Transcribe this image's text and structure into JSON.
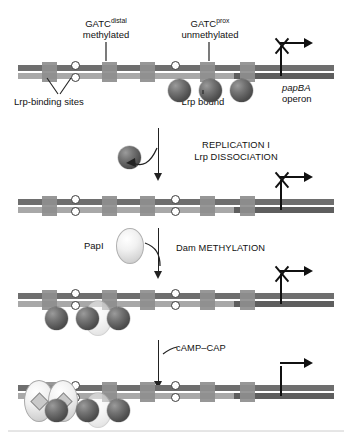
{
  "labels": {
    "gatc_distal": "GATC",
    "gatc_distal_sup": "distal",
    "gatc_distal_state": "methylated",
    "gatc_prox": "GATC",
    "gatc_prox_sup": "prox",
    "gatc_prox_state": "unmethylated",
    "lrp_binding_sites": "Lrp-binding sites",
    "lrp_bound": "Lrp bound",
    "operon_name": "papBA",
    "operon_word": "operon",
    "papi": "PapI",
    "camp_cap": "cAMP–CAP"
  },
  "steps": [
    {
      "line1": "REPLICATION I",
      "line2": "Lrp DISSOCIATION"
    },
    {
      "line1": "Dam METHYLATION",
      "line2": ""
    },
    {
      "line1": "cAMP–CAP",
      "line2": ""
    }
  ],
  "colors": {
    "strand_top": "#6e6e6e",
    "strand_bottom": "#a8a8a8",
    "operon_bar": "#5e5e5e",
    "lrp_site": "#8e8e8e",
    "lrp_protein": "#4f4f4f",
    "papi_protein": "#e8e8e8",
    "cap_protein": "#e8e8e8",
    "ink": "#111111"
  },
  "rows": [
    {
      "id": "row-1",
      "stage": "Phase OFF – Lrp bound at proximal sites",
      "promoter": {
        "active": false,
        "silenced_mark": "X"
      },
      "sites": [
        5
      ],
      "gatc": [
        {
          "name": "GATC-distal",
          "top": "methylated",
          "bottom": "methylated"
        },
        {
          "name": "GATC-proximal",
          "top": "unmethylated",
          "bottom": "unmethylated"
        }
      ],
      "lrp_count": 3,
      "lrp_positions": "proximal",
      "papi_present": false,
      "cap_present": false
    },
    {
      "id": "row-2",
      "stage": "After replication I – Lrp dissociated",
      "promoter": {
        "active": false,
        "silenced_mark": "X"
      },
      "sites": [
        5
      ],
      "gatc": [
        {
          "name": "GATC-distal",
          "top": "hemimethylated",
          "bottom": "hemimethylated"
        },
        {
          "name": "GATC-proximal",
          "top": "unmethylated",
          "bottom": "unmethylated"
        }
      ],
      "lrp_count": 0,
      "lrp_positions": "none",
      "papi_present": false,
      "cap_present": false
    },
    {
      "id": "row-3",
      "stage": "After Dam methylation – Lrp bound at distal sites",
      "promoter": {
        "active": false,
        "silenced_mark": "X"
      },
      "sites": [
        5
      ],
      "gatc": [
        {
          "name": "GATC-distal",
          "top": "unmethylated",
          "bottom": "unmethylated"
        },
        {
          "name": "GATC-proximal",
          "top": "methylated",
          "bottom": "methylated"
        }
      ],
      "lrp_count": 3,
      "lrp_positions": "distal",
      "papi_present": true,
      "cap_present": false
    },
    {
      "id": "row-4",
      "stage": "Phase ON – cAMP–CAP bound, transcription active",
      "promoter": {
        "active": true,
        "silenced_mark": ""
      },
      "sites": [
        5
      ],
      "gatc": [
        {
          "name": "GATC-distal",
          "top": "unmethylated",
          "bottom": "unmethylated"
        },
        {
          "name": "GATC-proximal",
          "top": "methylated",
          "bottom": "methylated"
        }
      ],
      "lrp_count": 3,
      "lrp_positions": "distal",
      "papi_present": true,
      "cap_present": true
    }
  ],
  "free_lrp": {
    "present": true,
    "label": "dissociated Lrp"
  }
}
